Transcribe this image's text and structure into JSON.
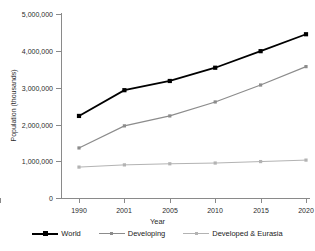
{
  "chart_data": {
    "type": "line",
    "title": "",
    "xlabel": "Year",
    "ylabel": "Population (thousands)",
    "categories": [
      "1990",
      "2001",
      "2005",
      "2010",
      "2015",
      "2020"
    ],
    "x": [
      1990,
      2001,
      2005,
      2010,
      2015,
      2020
    ],
    "ylim": [
      0,
      5000000
    ],
    "yticks": [
      0,
      1000000,
      2000000,
      3000000,
      4000000,
      5000000
    ],
    "ytick_labels": [
      "0",
      "1,000,000",
      "2,000,000",
      "3,000,000",
      "4,000,000",
      "5,000,000"
    ],
    "grid": false,
    "legend_position": "bottom",
    "series": [
      {
        "name": "World",
        "color": "#000000",
        "marker": "square",
        "values": [
          2230000,
          2930000,
          3180000,
          3540000,
          3990000,
          4450000
        ]
      },
      {
        "name": "Developing",
        "color": "#8c8c8c",
        "marker": "square",
        "values": [
          1360000,
          1960000,
          2230000,
          2610000,
          3070000,
          3570000
        ]
      },
      {
        "name": "Developed & Eurasia",
        "color": "#b3b3b3",
        "marker": "square",
        "values": [
          840000,
          900000,
          930000,
          950000,
          990000,
          1030000
        ]
      }
    ]
  },
  "axes": {
    "y_title": "Population (thousands)",
    "x_title": "Year",
    "y_labels": [
      "5,000,000",
      "4,000,000",
      "3,000,000",
      "2,000,000",
      "1,000,000",
      "0"
    ],
    "x_labels": [
      "1990",
      "2001",
      "2005",
      "2010",
      "2015",
      "2020"
    ]
  },
  "legend": {
    "items": [
      {
        "label": "World",
        "color": "#000000"
      },
      {
        "label": "Developing",
        "color": "#8c8c8c"
      },
      {
        "label": "Developed & Eurasia",
        "color": "#b3b3b3"
      }
    ]
  }
}
